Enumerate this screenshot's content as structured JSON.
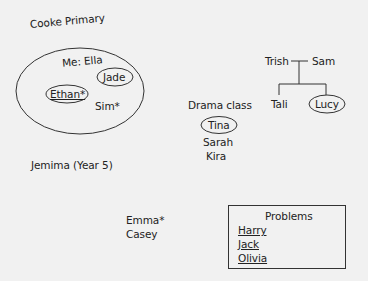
{
  "diagram": {
    "school": {
      "title": "Cooke Primary"
    },
    "friend_group": {
      "self_label": "Me: Ella",
      "members": [
        {
          "name": "Jade",
          "circled": true,
          "underlined": false,
          "starred": false
        },
        {
          "name": "Ethan*",
          "circled": true,
          "underlined": true,
          "starred": true
        },
        {
          "name": "Sim*",
          "circled": false,
          "underlined": false,
          "starred": true
        }
      ]
    },
    "other_school": {
      "name": "Jemima (Year 5)"
    },
    "family": {
      "parents": [
        "Trish",
        "Sam"
      ],
      "children": [
        {
          "name": "Tali",
          "circled": false
        },
        {
          "name": "Lucy",
          "circled": true
        }
      ]
    },
    "drama_class": {
      "label": "Drama class",
      "members": [
        {
          "name": "Tina",
          "circled": true
        },
        {
          "name": "Sarah",
          "circled": false
        },
        {
          "name": "Kira",
          "circled": false
        }
      ]
    },
    "loose_names": [
      "Emma*",
      "Casey"
    ],
    "problems": {
      "title": "Problems",
      "names": [
        "Harry",
        "Jack",
        "Olivia"
      ]
    },
    "colors": {
      "background": "#f1f1f1",
      "ink": "#222222"
    }
  }
}
